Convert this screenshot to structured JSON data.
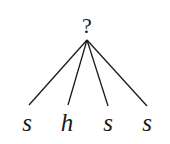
{
  "tree": {
    "root": {
      "label": "?",
      "x": 87,
      "y": 40
    },
    "leaves": [
      {
        "label": "s",
        "x": 28,
        "y": 105
      },
      {
        "label": "h",
        "x": 68,
        "y": 105
      },
      {
        "label": "s",
        "x": 108,
        "y": 106
      },
      {
        "label": "s",
        "x": 147,
        "y": 106
      }
    ]
  }
}
